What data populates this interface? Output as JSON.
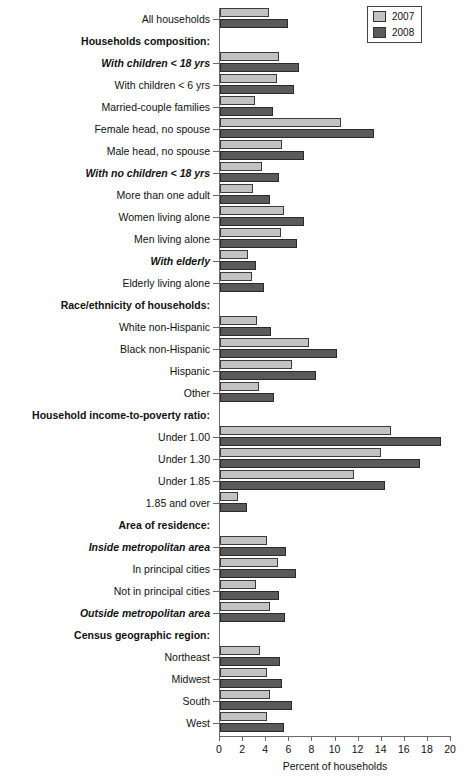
{
  "legend": {
    "entries": [
      {
        "label": "2007",
        "color": "#c2c2c2"
      },
      {
        "label": "2008",
        "color": "#5a5a5a"
      }
    ]
  },
  "axis": {
    "xlabel": "Percent of households",
    "ticks": [
      "0",
      "2",
      "4",
      "6",
      "8",
      "10",
      "12",
      "14",
      "16",
      "18",
      "20"
    ]
  },
  "chart_data": {
    "type": "bar",
    "title": "",
    "subtitle": "",
    "xlabel": "Percent of households",
    "ylabel": "",
    "xlim": [
      0,
      20
    ],
    "grid": false,
    "orientation": "horizontal",
    "legend_position": "top-right",
    "legend": [
      "2007",
      "2008"
    ],
    "categories": [
      "All households",
      "Households composition:",
      "With children < 18 yrs",
      "With children < 6 yrs",
      "Married-couple families",
      "Female head, no spouse",
      "Male head, no spouse",
      "With no children < 18 yrs",
      "More than one adult",
      "Women living alone",
      "Men living alone",
      "With elderly",
      "Elderly living alone",
      "Race/ethnicity of households:",
      "White non-Hispanic",
      "Black non-Hispanic",
      "Hispanic",
      "Other",
      "Household income-to-poverty ratio:",
      "Under 1.00",
      "Under 1.30",
      "Under 1.85",
      "1.85 and over",
      "Area of residence:",
      "Inside metropolitan area",
      "In principal cities",
      "Not in principal cities",
      "Outside metropolitan area",
      "Census geographic region:",
      "Northeast",
      "Midwest",
      "South",
      "West"
    ],
    "category_styles": [
      "normal",
      "heading",
      "subheading",
      "normal",
      "normal",
      "normal",
      "normal",
      "subheading",
      "normal",
      "normal",
      "normal",
      "subheading",
      "normal",
      "heading",
      "normal",
      "normal",
      "normal",
      "normal",
      "heading",
      "normal",
      "normal",
      "normal",
      "normal",
      "heading",
      "subheading",
      "normal",
      "normal",
      "subheading",
      "heading",
      "normal",
      "normal",
      "normal",
      "normal"
    ],
    "series": [
      {
        "name": "2007",
        "color": "#c2c2c2",
        "values": [
          4.2,
          null,
          5.1,
          4.9,
          3.0,
          10.5,
          5.4,
          3.6,
          2.9,
          5.5,
          5.3,
          2.4,
          2.8,
          null,
          3.2,
          7.7,
          6.2,
          3.4,
          null,
          14.8,
          13.9,
          11.6,
          1.6,
          null,
          4.1,
          5.0,
          3.1,
          4.3,
          null,
          3.5,
          4.1,
          4.3,
          4.1
        ]
      },
      {
        "name": "2008",
        "color": "#5a5a5a",
        "values": [
          5.9,
          null,
          6.8,
          6.4,
          4.6,
          13.3,
          7.3,
          5.1,
          4.3,
          7.3,
          6.7,
          3.1,
          3.8,
          null,
          4.4,
          10.1,
          8.3,
          4.7,
          null,
          19.1,
          17.3,
          14.3,
          2.3,
          null,
          5.7,
          6.6,
          5.1,
          5.6,
          null,
          5.2,
          5.4,
          6.2,
          5.5
        ]
      }
    ]
  }
}
